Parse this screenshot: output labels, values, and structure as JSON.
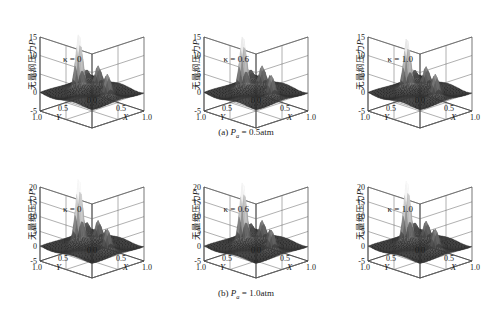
{
  "figure": {
    "background": "#ffffff",
    "axis_label_zh": "无量纲压力",
    "axis_label_sym": "P",
    "x_axis_name": "X",
    "y_axis_name": "Y",
    "x_ticks": [
      "0",
      "0.5",
      "1.0"
    ],
    "y_ticks": [
      "1.0",
      "0.5",
      "0"
    ],
    "surface_colormap": [
      "#2b2b2b",
      "#4a4a4a",
      "#6e6e6e",
      "#9a9a9a",
      "#c4c4c4",
      "#e8e8e8",
      "#fcfcfc"
    ]
  },
  "rows": [
    {
      "id": "row-a",
      "caption_prefix": "(a)",
      "caption_sym": "P",
      "caption_sub": "a",
      "caption_value": "= 0.5atm",
      "caption_full": "(a) Pa = 0.5atm",
      "z_ticks": [
        "15",
        "10",
        "5",
        "0",
        "-5"
      ],
      "z_min": -5,
      "z_max": 15,
      "panels": [
        {
          "kappa_label": "κ = 0",
          "kappa_value": 0
        },
        {
          "kappa_label": "κ = 0.6",
          "kappa_value": 0.6
        },
        {
          "kappa_label": "κ = 1.0",
          "kappa_value": 1.0
        }
      ]
    },
    {
      "id": "row-b",
      "caption_prefix": "(b)",
      "caption_sym": "P",
      "caption_sub": "a",
      "caption_value": "= 1.0atm",
      "caption_full": "(b) Pa = 1.0atm",
      "z_ticks": [
        "20",
        "15",
        "10",
        "5",
        "0",
        "-5"
      ],
      "z_min": -5,
      "z_max": 20,
      "panels": [
        {
          "kappa_label": "κ = 0",
          "kappa_value": 0
        },
        {
          "kappa_label": "κ = 0.6",
          "kappa_value": 0.6
        },
        {
          "kappa_label": "κ = 1.0",
          "kappa_value": 1.0
        }
      ]
    }
  ],
  "chart_data": {
    "type": "surface",
    "title": "",
    "xlabel": "X",
    "ylabel": "Y",
    "zlabel": "无量纲压力P",
    "xlim": [
      0,
      1.0
    ],
    "ylim": [
      0,
      1.0
    ],
    "grid": true,
    "legend": "none",
    "panels": [
      {
        "row": "(a) Pa = 0.5atm",
        "kappa": 0,
        "zlim": [
          -5,
          15
        ],
        "zticks": [
          -5,
          0,
          5,
          10,
          15
        ],
        "peaks": [
          {
            "x": 0.3,
            "y": 0.55,
            "z": 13.0
          },
          {
            "x": 0.42,
            "y": 0.3,
            "z": 5.0
          },
          {
            "x": 0.62,
            "y": 0.35,
            "z": 4.0
          },
          {
            "x": 0.8,
            "y": 0.5,
            "z": 5.5
          },
          {
            "x": 0.12,
            "y": 0.22,
            "z": 2.5
          }
        ],
        "baseline": 0
      },
      {
        "row": "(a) Pa = 0.5atm",
        "kappa": 0.6,
        "zlim": [
          -5,
          15
        ],
        "zticks": [
          -5,
          0,
          5,
          10,
          15
        ],
        "peaks": [
          {
            "x": 0.3,
            "y": 0.55,
            "z": 12.5
          },
          {
            "x": 0.42,
            "y": 0.3,
            "z": 5.0
          },
          {
            "x": 0.62,
            "y": 0.35,
            "z": 4.2
          },
          {
            "x": 0.8,
            "y": 0.5,
            "z": 5.2
          },
          {
            "x": 0.12,
            "y": 0.22,
            "z": 2.5
          }
        ],
        "baseline": 0
      },
      {
        "row": "(a) Pa = 0.5atm",
        "kappa": 1.0,
        "zlim": [
          -5,
          15
        ],
        "zticks": [
          -5,
          0,
          5,
          10,
          15
        ],
        "peaks": [
          {
            "x": 0.3,
            "y": 0.55,
            "z": 12.0
          },
          {
            "x": 0.42,
            "y": 0.3,
            "z": 4.8
          },
          {
            "x": 0.62,
            "y": 0.35,
            "z": 4.0
          },
          {
            "x": 0.8,
            "y": 0.5,
            "z": 5.5
          },
          {
            "x": 0.12,
            "y": 0.22,
            "z": 2.4
          }
        ],
        "baseline": 0
      },
      {
        "row": "(b) Pa = 1.0atm",
        "kappa": 0,
        "zlim": [
          -5,
          20
        ],
        "zticks": [
          -5,
          0,
          5,
          10,
          15,
          20
        ],
        "peaks": [
          {
            "x": 0.3,
            "y": 0.55,
            "z": 19.0
          },
          {
            "x": 0.42,
            "y": 0.3,
            "z": 6.0
          },
          {
            "x": 0.62,
            "y": 0.35,
            "z": 5.0
          },
          {
            "x": 0.8,
            "y": 0.5,
            "z": 6.5
          },
          {
            "x": 0.12,
            "y": 0.22,
            "z": 3.5
          }
        ],
        "baseline": 0
      },
      {
        "row": "(b) Pa = 1.0atm",
        "kappa": 0.6,
        "zlim": [
          -5,
          20
        ],
        "zticks": [
          -5,
          0,
          5,
          10,
          15,
          20
        ],
        "peaks": [
          {
            "x": 0.3,
            "y": 0.55,
            "z": 18.0
          },
          {
            "x": 0.42,
            "y": 0.3,
            "z": 6.0
          },
          {
            "x": 0.62,
            "y": 0.35,
            "z": 5.0
          },
          {
            "x": 0.8,
            "y": 0.5,
            "z": 6.2
          },
          {
            "x": 0.12,
            "y": 0.22,
            "z": 3.2
          }
        ],
        "baseline": 0
      },
      {
        "row": "(b) Pa = 1.0atm",
        "kappa": 1.0,
        "zlim": [
          -5,
          20
        ],
        "zticks": [
          -5,
          0,
          5,
          10,
          15,
          20
        ],
        "peaks": [
          {
            "x": 0.3,
            "y": 0.55,
            "z": 18.5
          },
          {
            "x": 0.42,
            "y": 0.3,
            "z": 5.8
          },
          {
            "x": 0.62,
            "y": 0.35,
            "z": 5.0
          },
          {
            "x": 0.8,
            "y": 0.5,
            "z": 6.5
          },
          {
            "x": 0.12,
            "y": 0.22,
            "z": 3.4
          }
        ],
        "baseline": 0
      }
    ]
  }
}
